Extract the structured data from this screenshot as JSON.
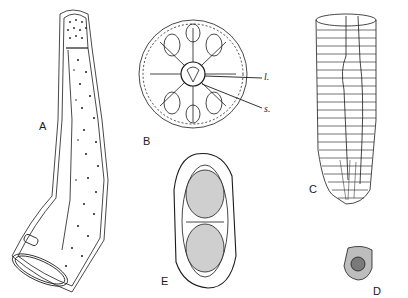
{
  "figure": {
    "panels": [
      {
        "id": "A",
        "label": "A",
        "description": "elongated curved tubular body with dotted surface and spiny anterior end"
      },
      {
        "id": "B",
        "label": "B",
        "description": "circular radial disc with central structure and radiating arms",
        "annotations": [
          {
            "label": "l."
          },
          {
            "label": "s."
          }
        ]
      },
      {
        "id": "C",
        "label": "C",
        "description": "cylindrical annulated tube with internal canals"
      },
      {
        "id": "D",
        "label": "D",
        "description": "small rounded granular body"
      },
      {
        "id": "E",
        "label": "E",
        "description": "oval capsule with granular contents"
      }
    ],
    "colors": {
      "ink": "#1a1a1a",
      "background": "#ffffff"
    }
  }
}
